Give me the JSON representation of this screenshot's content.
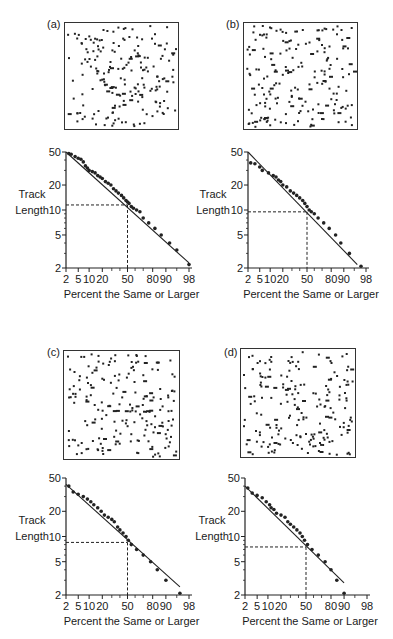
{
  "chart_data": [
    {
      "panel": "(a)",
      "type": "scatter",
      "title": "",
      "xlabel": "Percent the Same or Larger",
      "ylabel": "Track Length",
      "x_scale": "probability",
      "y_scale": "log",
      "x_ticks": [
        2,
        5,
        10,
        20,
        50,
        80,
        90,
        98
      ],
      "y_ticks": [
        2,
        5,
        10,
        20,
        50
      ],
      "ylim": [
        2,
        50
      ],
      "xlim": [
        2,
        98
      ],
      "median_marker": {
        "x": 50,
        "y": 11.5
      },
      "fit_line": {
        "from": [
          2,
          50
        ],
        "to": [
          98,
          2.3
        ]
      },
      "points": [
        [
          2.5,
          48
        ],
        [
          3,
          47
        ],
        [
          4,
          44
        ],
        [
          5,
          42
        ],
        [
          6,
          41
        ],
        [
          7,
          38
        ],
        [
          8,
          34
        ],
        [
          9,
          32
        ],
        [
          10,
          30
        ],
        [
          12,
          29
        ],
        [
          14,
          28
        ],
        [
          16,
          26
        ],
        [
          18,
          25
        ],
        [
          20,
          24
        ],
        [
          23,
          22
        ],
        [
          26,
          21
        ],
        [
          29,
          20
        ],
        [
          32,
          18
        ],
        [
          35,
          17
        ],
        [
          38,
          16
        ],
        [
          42,
          15
        ],
        [
          45,
          14
        ],
        [
          48,
          13
        ],
        [
          50,
          12.5
        ],
        [
          52,
          12
        ],
        [
          55,
          11
        ],
        [
          58,
          10.5
        ],
        [
          62,
          10
        ],
        [
          66,
          9.5
        ],
        [
          70,
          8
        ],
        [
          76,
          7
        ],
        [
          82,
          6
        ],
        [
          87,
          5
        ],
        [
          92,
          4
        ],
        [
          95,
          3.3
        ],
        [
          98,
          2.2
        ]
      ]
    },
    {
      "panel": "(b)",
      "type": "scatter",
      "xlabel": "Percent the Same or Larger",
      "ylabel": "Track Length",
      "x_scale": "probability",
      "y_scale": "log",
      "x_ticks": [
        2,
        5,
        10,
        20,
        50,
        80,
        90,
        98
      ],
      "y_ticks": [
        2,
        5,
        10,
        20,
        50
      ],
      "ylim": [
        2,
        50
      ],
      "xlim": [
        2,
        98
      ],
      "median_marker": {
        "x": 50,
        "y": 9.5
      },
      "fit_line": {
        "from": [
          2,
          50
        ],
        "to": [
          96,
          2.2
        ]
      },
      "points": [
        [
          2.5,
          37
        ],
        [
          3.5,
          36
        ],
        [
          5,
          33
        ],
        [
          6,
          30
        ],
        [
          9,
          28
        ],
        [
          12,
          26
        ],
        [
          14,
          25
        ],
        [
          16,
          23
        ],
        [
          18,
          22
        ],
        [
          20,
          20
        ],
        [
          24,
          19
        ],
        [
          28,
          17
        ],
        [
          32,
          16
        ],
        [
          36,
          15
        ],
        [
          40,
          14
        ],
        [
          44,
          13
        ],
        [
          47,
          12
        ],
        [
          50,
          11
        ],
        [
          53,
          10
        ],
        [
          56,
          9.5
        ],
        [
          60,
          9
        ],
        [
          65,
          8
        ],
        [
          72,
          7
        ],
        [
          78,
          6
        ],
        [
          84,
          5
        ],
        [
          88,
          4
        ],
        [
          93,
          3
        ],
        [
          97,
          2.1
        ]
      ]
    },
    {
      "panel": "(c)",
      "type": "scatter",
      "xlabel": "Percent the Same or Larger",
      "ylabel": "Track Length",
      "x_scale": "probability",
      "y_scale": "log",
      "x_ticks": [
        2,
        5,
        10,
        20,
        50,
        80,
        90,
        98
      ],
      "y_ticks": [
        2,
        5,
        10,
        20,
        50
      ],
      "ylim": [
        2,
        50
      ],
      "xlim": [
        2,
        98
      ],
      "median_marker": {
        "x": 50,
        "y": 8.5
      },
      "fit_line": {
        "from": [
          2,
          42
        ],
        "to": [
          96,
          2.5
        ]
      },
      "points": [
        [
          2.5,
          40
        ],
        [
          3.5,
          34
        ],
        [
          5,
          32
        ],
        [
          7,
          30
        ],
        [
          9,
          28
        ],
        [
          11,
          26
        ],
        [
          13,
          24
        ],
        [
          16,
          22
        ],
        [
          19,
          20
        ],
        [
          22,
          18
        ],
        [
          26,
          17
        ],
        [
          30,
          16
        ],
        [
          33,
          15
        ],
        [
          37,
          13
        ],
        [
          40,
          12
        ],
        [
          44,
          11
        ],
        [
          48,
          10
        ],
        [
          51,
          9
        ],
        [
          55,
          8
        ],
        [
          62,
          7
        ],
        [
          70,
          6
        ],
        [
          78,
          5
        ],
        [
          84,
          4
        ],
        [
          90,
          3
        ],
        [
          96,
          2.1
        ]
      ]
    },
    {
      "panel": "(d)",
      "type": "scatter",
      "xlabel": "Percent the Same or Larger",
      "ylabel": "Track Length",
      "x_scale": "probability",
      "y_scale": "log",
      "x_ticks": [
        2,
        5,
        10,
        20,
        50,
        80,
        90,
        98
      ],
      "y_ticks": [
        2,
        5,
        10,
        20,
        50
      ],
      "ylim": [
        2,
        50
      ],
      "xlim": [
        2,
        98
      ],
      "median_marker": {
        "x": 50,
        "y": 7.5
      },
      "fit_line": {
        "from": [
          2,
          40
        ],
        "to": [
          90,
          2.8
        ]
      },
      "points": [
        [
          2.5,
          38
        ],
        [
          3.5,
          33
        ],
        [
          5,
          31
        ],
        [
          7,
          29
        ],
        [
          9,
          26
        ],
        [
          11,
          24
        ],
        [
          12,
          22
        ],
        [
          14,
          21
        ],
        [
          16,
          19
        ],
        [
          20,
          18
        ],
        [
          24,
          17
        ],
        [
          27,
          15
        ],
        [
          30,
          14
        ],
        [
          34,
          13
        ],
        [
          38,
          12
        ],
        [
          42,
          11
        ],
        [
          45,
          10
        ],
        [
          48,
          9
        ],
        [
          52,
          8
        ],
        [
          58,
          7
        ],
        [
          66,
          6
        ],
        [
          74,
          5
        ],
        [
          80,
          4
        ],
        [
          85,
          3
        ],
        [
          90,
          2.1
        ]
      ]
    }
  ],
  "panels": [
    {
      "label": "(a)"
    },
    {
      "label": "(b)"
    },
    {
      "label": "(c)"
    },
    {
      "label": "(d)"
    }
  ],
  "axis": {
    "ylabel_line1": "Track",
    "ylabel_line2": "Length",
    "xlabel": "Percent the Same or Larger",
    "x_tick_labels": [
      "2",
      "5",
      "10",
      "20",
      "50",
      "80",
      "90",
      "98"
    ],
    "y_tick_labels": [
      "50",
      "20",
      "10",
      "5",
      "2"
    ]
  }
}
